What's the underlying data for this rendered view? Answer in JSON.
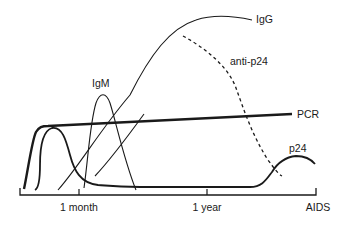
{
  "diagram": {
    "type": "time-course of serologic and virologic markers",
    "curve_labels": {
      "igg": "IgG",
      "anti_p24": "anti-p24",
      "igm": "IgM",
      "pcr": "PCR",
      "p24": "p24"
    },
    "axis": {
      "ticks": [
        "1 month",
        "1 year",
        "AIDS"
      ]
    },
    "colors": {
      "ink": "#1a1a1a",
      "background": "#ffffff"
    }
  }
}
